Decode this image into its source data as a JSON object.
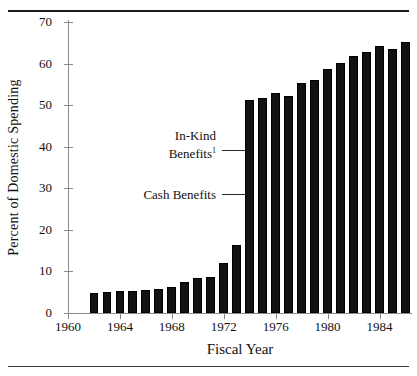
{
  "chart_data": {
    "type": "bar",
    "title": "",
    "xlabel": "Fiscal Year",
    "ylabel": "Percent of Domestic Spending",
    "ylim": [
      0,
      70
    ],
    "yticks": [
      0,
      10,
      20,
      30,
      40,
      50,
      60,
      70
    ],
    "xlim": [
      1960,
      1986.5
    ],
    "xticks": [
      1960,
      1964,
      1968,
      1972,
      1976,
      1980,
      1984
    ],
    "grid": false,
    "legend": "none",
    "x": [
      1962,
      1963,
      1964,
      1965,
      1966,
      1967,
      1968,
      1969,
      1970,
      1971,
      1972,
      1973,
      1974,
      1975,
      1976,
      1977,
      1978,
      1979,
      1980,
      1981,
      1982,
      1983,
      1984,
      1985,
      1986
    ],
    "categories": [
      "1962",
      "1963",
      "1964",
      "1965",
      "1966",
      "1967",
      "1968",
      "1969",
      "1970",
      "1971",
      "1972",
      "1973",
      "1974",
      "1975",
      "1976",
      "1977",
      "1978",
      "1979",
      "1980",
      "1981",
      "1982",
      "1983",
      "1984",
      "1985",
      "1986"
    ],
    "values": [
      4.8,
      5.0,
      5.2,
      5.4,
      5.6,
      5.8,
      6.2,
      7.5,
      8.4,
      8.7,
      12.0,
      16.4,
      51.2,
      51.8,
      53.0,
      52.3,
      55.4,
      56.0,
      58.6,
      60.2,
      61.8,
      62.8,
      64.2,
      63.6,
      65.2
    ],
    "annotations": [
      {
        "name": "in-kind-benefits",
        "text": "In-Kind",
        "text2": "Benefits",
        "superscript": "1"
      },
      {
        "name": "cash-benefits",
        "text": "Cash Benefits",
        "superscript": ""
      }
    ]
  }
}
